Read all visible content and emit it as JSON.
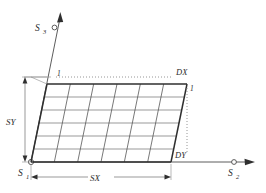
{
  "diagram": {
    "background_color": "#ffffff",
    "line_color": "#3a3a3a",
    "grid_color": "#555555",
    "faint_color": "#8a8a8a",
    "text_color": "#2b2b2b",
    "axes": [
      {
        "id": "axis-s3",
        "label": "S",
        "subscript": "3",
        "direction": "up",
        "has_arrow": true,
        "has_node_circle": true
      },
      {
        "id": "axis-s2",
        "label": "S",
        "subscript": "2",
        "direction": "right",
        "has_arrow": true,
        "has_node_circle": true
      },
      {
        "id": "origin-s1",
        "label": "S",
        "subscript": "1",
        "direction": "origin",
        "has_arrow": false,
        "has_node_circle": true
      }
    ],
    "dimensions": [
      {
        "id": "dim-sy",
        "label": "SY",
        "orientation": "vertical",
        "arrows": "both"
      },
      {
        "id": "dim-sx",
        "label": "SX",
        "orientation": "horizontal",
        "arrows": "both"
      }
    ],
    "offsets": [
      {
        "id": "offset-dx",
        "label": "DX",
        "leader": "dotted-horizontal"
      },
      {
        "id": "offset-dy",
        "label": "DY",
        "leader": "dotted-vertical"
      }
    ],
    "corner_marks": [
      {
        "id": "corner-mark-top-left",
        "label": "1"
      },
      {
        "id": "corner-mark-top-right",
        "label": "1"
      }
    ],
    "grid": {
      "columns": 6,
      "rows": 6
    }
  }
}
